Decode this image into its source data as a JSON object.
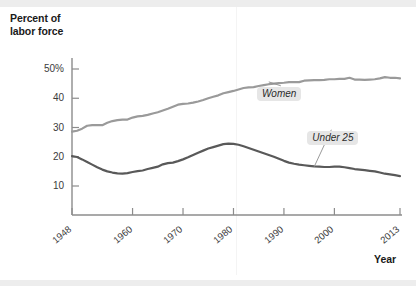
{
  "figure": {
    "y_caption": "Percent of\nlabor force",
    "y_caption_line1": "Percent of",
    "y_caption_line2": "labor force",
    "x_caption": "Year"
  },
  "chart_data": {
    "type": "line",
    "title": "",
    "subtitle": "",
    "xlabel": "Year",
    "ylabel": "Percent of labor force",
    "xlim": [
      1948,
      2013
    ],
    "ylim": [
      5,
      52
    ],
    "grid": false,
    "legend": "inline-annotations",
    "xticks": [
      1948,
      1960,
      1970,
      1980,
      1990,
      2000,
      2013
    ],
    "xtick_labels": [
      "1948",
      "1960",
      "1970",
      "1980",
      "1990",
      "2000",
      "2013"
    ],
    "yticks": [
      10,
      20,
      30,
      40,
      50
    ],
    "ytick_labels": [
      "10",
      "20",
      "30",
      "40",
      "50%"
    ],
    "colors": {
      "women": "#9a9a9a",
      "under25": "#595959",
      "axis": "#8c8c8c",
      "label_box": "#e6e6e6"
    },
    "annotations": [
      {
        "text": "Women",
        "x": 1989,
        "y": 41.5,
        "anchor_x": 1987,
        "anchor_y": 45.6
      },
      {
        "text": "Under 25",
        "x": 1999,
        "y": 26.5,
        "anchor_x": 1996,
        "anchor_y": 16.6
      }
    ],
    "series": [
      {
        "name": "Women",
        "color": "#9a9a9a",
        "x": [
          1948,
          1949,
          1950,
          1951,
          1952,
          1953,
          1954,
          1955,
          1956,
          1957,
          1958,
          1959,
          1960,
          1961,
          1962,
          1963,
          1964,
          1965,
          1966,
          1967,
          1968,
          1969,
          1970,
          1971,
          1972,
          1973,
          1974,
          1975,
          1976,
          1977,
          1978,
          1979,
          1980,
          1981,
          1982,
          1983,
          1984,
          1985,
          1986,
          1987,
          1988,
          1989,
          1990,
          1991,
          1992,
          1993,
          1994,
          1995,
          1996,
          1997,
          1998,
          1999,
          2000,
          2001,
          2002,
          2003,
          2004,
          2005,
          2006,
          2007,
          2008,
          2009,
          2010,
          2011,
          2012,
          2013
        ],
        "values": [
          28.6,
          28.9,
          29.6,
          30.6,
          30.8,
          30.8,
          30.8,
          31.6,
          32.2,
          32.5,
          32.7,
          32.7,
          33.4,
          33.8,
          34.0,
          34.3,
          34.8,
          35.2,
          35.8,
          36.4,
          37.1,
          37.8,
          38.1,
          38.2,
          38.5,
          38.9,
          39.4,
          40.0,
          40.5,
          41.0,
          41.7,
          42.1,
          42.5,
          43.0,
          43.5,
          43.7,
          43.8,
          44.2,
          44.5,
          44.8,
          45.0,
          45.2,
          45.3,
          45.5,
          45.5,
          45.5,
          46.0,
          46.1,
          46.2,
          46.2,
          46.3,
          46.5,
          46.5,
          46.6,
          46.6,
          47.0,
          46.4,
          46.4,
          46.3,
          46.4,
          46.5,
          46.8,
          47.2,
          47.0,
          47.0,
          46.8
        ]
      },
      {
        "name": "Under 25",
        "color": "#595959",
        "x": [
          1948,
          1949,
          1950,
          1951,
          1952,
          1953,
          1954,
          1955,
          1956,
          1957,
          1958,
          1959,
          1960,
          1961,
          1962,
          1963,
          1964,
          1965,
          1966,
          1967,
          1968,
          1969,
          1970,
          1971,
          1972,
          1973,
          1974,
          1975,
          1976,
          1977,
          1978,
          1979,
          1980,
          1981,
          1982,
          1983,
          1984,
          1985,
          1986,
          1987,
          1988,
          1989,
          1990,
          1991,
          1992,
          1993,
          1994,
          1995,
          1996,
          1997,
          1998,
          1999,
          2000,
          2001,
          2002,
          2003,
          2004,
          2005,
          2006,
          2007,
          2008,
          2009,
          2010,
          2011,
          2012,
          2013
        ],
        "values": [
          20.2,
          19.9,
          19.1,
          18.2,
          17.3,
          16.4,
          15.6,
          15.0,
          14.6,
          14.3,
          14.2,
          14.4,
          14.8,
          15.1,
          15.3,
          15.8,
          16.2,
          16.6,
          17.4,
          17.8,
          18.0,
          18.5,
          19.1,
          19.8,
          20.6,
          21.4,
          22.1,
          22.8,
          23.3,
          23.8,
          24.3,
          24.5,
          24.4,
          24.1,
          23.6,
          23.0,
          22.4,
          21.8,
          21.2,
          20.6,
          20.0,
          19.3,
          18.6,
          18.0,
          17.6,
          17.3,
          17.1,
          16.9,
          16.7,
          16.6,
          16.5,
          16.5,
          16.6,
          16.6,
          16.4,
          16.1,
          15.8,
          15.6,
          15.4,
          15.2,
          15.0,
          14.6,
          14.2,
          14.0,
          13.7,
          13.4
        ]
      }
    ]
  }
}
